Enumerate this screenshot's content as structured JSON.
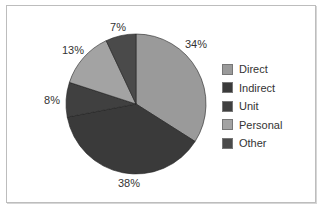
{
  "chart_data": {
    "type": "pie",
    "title": "",
    "start_angle_deg": 0,
    "direction": "clockwise",
    "slices": [
      {
        "name": "Direct",
        "value": 34,
        "label": "34%",
        "color": "#9a9a9a"
      },
      {
        "name": "Indirect",
        "value": 38,
        "label": "38%",
        "color": "#3a3a3a"
      },
      {
        "name": "Unit",
        "value": 8,
        "label": "8%",
        "color": "#404040"
      },
      {
        "name": "Personal",
        "value": 13,
        "label": "13%",
        "color": "#a3a3a3"
      },
      {
        "name": "Other",
        "value": 7,
        "label": "7%",
        "color": "#4a4a4a"
      }
    ],
    "legend": {
      "position": "right",
      "entries": [
        "Direct",
        "Indirect",
        "Unit",
        "Personal",
        "Other"
      ]
    }
  },
  "legend": {
    "items": [
      {
        "label": "Direct",
        "color": "#9a9a9a"
      },
      {
        "label": "Indirect",
        "color": "#3a3a3a"
      },
      {
        "label": "Unit",
        "color": "#404040"
      },
      {
        "label": "Personal",
        "color": "#a3a3a3"
      },
      {
        "label": "Other",
        "color": "#4a4a4a"
      }
    ]
  },
  "labels": {
    "direct": "34%",
    "indirect": "38%",
    "unit": "8%",
    "personal": "13%",
    "other": "7%"
  }
}
